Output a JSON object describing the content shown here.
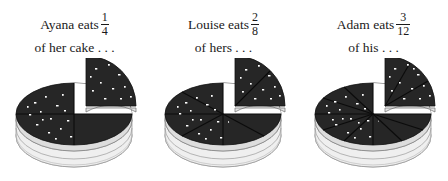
{
  "page": {
    "background_color": "#ffffff"
  },
  "colors": {
    "cake_top_dark": "#262626",
    "cake_top_dark2": "#1d1d1d",
    "cake_side_light": "#ececec",
    "cake_side_shade": "#d2d2d2",
    "speckle": "#ffffff",
    "outline": "#111111",
    "text": "#1a1a1a"
  },
  "columns": [
    {
      "id": "ayana",
      "caption": {
        "lead": "Ayana eats",
        "numerator": "1",
        "denominator": "4",
        "line2": "of her cake . . ."
      },
      "cake": {
        "total_slices": 4,
        "separated_slices": 1,
        "fraction_label": "1/4"
      }
    },
    {
      "id": "louise",
      "caption": {
        "lead": "Louise eats",
        "numerator": "2",
        "denominator": "8",
        "line2": "of hers . . ."
      },
      "cake": {
        "total_slices": 8,
        "separated_slices": 2,
        "fraction_label": "2/8"
      }
    },
    {
      "id": "adam",
      "caption": {
        "lead": "Adam eats",
        "numerator": "3",
        "denominator": "12",
        "line2": "of his . . ."
      },
      "cake": {
        "total_slices": 12,
        "separated_slices": 3,
        "fraction_label": "3/12"
      }
    }
  ]
}
